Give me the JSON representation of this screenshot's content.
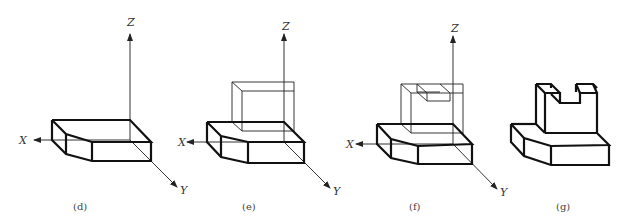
{
  "figure": {
    "panels": [
      {
        "id": "d",
        "caption": "(d)",
        "axes": {
          "x": "X",
          "y": "Y",
          "z": "Z"
        },
        "description": "Base plate with chamfered front-left corner"
      },
      {
        "id": "e",
        "caption": "(e)",
        "axes": {
          "x": "X",
          "y": "Y",
          "z": "Z"
        },
        "description": "Base plate plus thin-line rectangular box placed on top"
      },
      {
        "id": "f",
        "caption": "(f)",
        "axes": {
          "x": "X",
          "y": "Y",
          "z": "Z"
        },
        "description": "Base plate plus thin-line box with slot cut at top"
      },
      {
        "id": "g",
        "caption": "(g)",
        "axes": {},
        "description": "Final solid: base plate with slotted upright block"
      }
    ]
  },
  "colors": {
    "line": "#111111",
    "background": "#ffffff"
  }
}
